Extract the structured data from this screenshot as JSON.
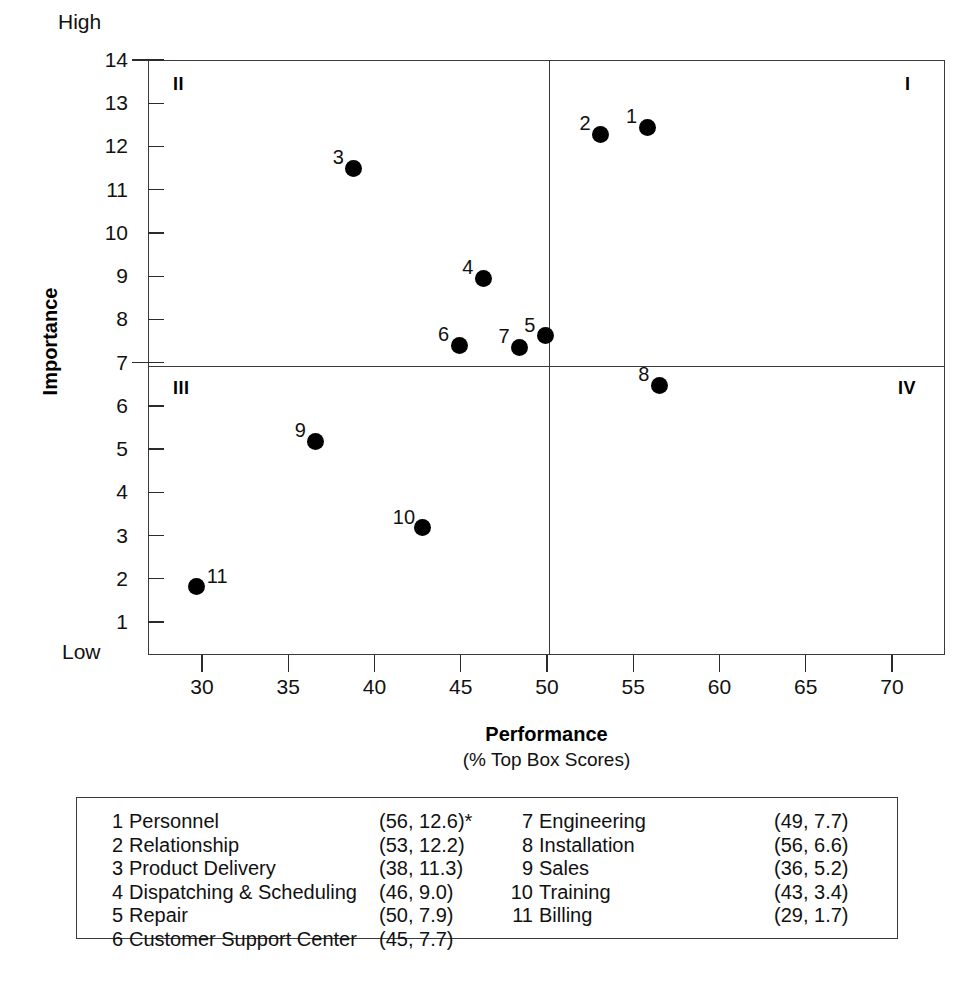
{
  "chart_data": {
    "type": "scatter",
    "title": "",
    "xlabel": "Performance",
    "xlabel_sub": "(% Top Box Scores)",
    "ylabel": "Importance",
    "y_high_label": "High",
    "y_low_label": "Low",
    "xlim": [
      27,
      73
    ],
    "ylim": [
      1,
      14
    ],
    "xticks": [
      30,
      35,
      40,
      45,
      50,
      55,
      60,
      65,
      70
    ],
    "yticks": [
      1,
      2,
      3,
      4,
      5,
      6,
      7,
      8,
      9,
      10,
      11,
      12,
      13,
      14
    ],
    "grid": false,
    "legend_position": "below-plot-boxed",
    "quadrant_divider_x": 50,
    "quadrant_divider_y": 7,
    "quadrants": [
      {
        "id": "q1",
        "label": "I",
        "position": "top-right"
      },
      {
        "id": "q2",
        "label": "II",
        "position": "top-left"
      },
      {
        "id": "q3",
        "label": "III",
        "position": "bottom-left"
      },
      {
        "id": "q4",
        "label": "IV",
        "position": "bottom-right"
      }
    ],
    "point_labels": [
      "1",
      "2",
      "3",
      "4",
      "5",
      "6",
      "7",
      "8",
      "9",
      "10",
      "11"
    ],
    "x": [
      56,
      53,
      38,
      46,
      50,
      45,
      49,
      56,
      36,
      43,
      29
    ],
    "y": [
      12.6,
      12.2,
      11.3,
      9.0,
      7.9,
      7.7,
      7.7,
      6.6,
      5.2,
      3.4,
      1.7
    ],
    "points": [
      {
        "id": "1",
        "name": "Personnel",
        "x": 56,
        "y": 12.6,
        "plot_x": 55.8,
        "plot_y": 12.45,
        "label_side": "left"
      },
      {
        "id": "2",
        "name": "Relationship",
        "x": 53,
        "y": 12.2,
        "plot_x": 53.1,
        "plot_y": 12.28,
        "label_side": "left"
      },
      {
        "id": "3",
        "name": "Product Delivery",
        "x": 38,
        "y": 11.3,
        "plot_x": 38.8,
        "plot_y": 11.5,
        "label_side": "left"
      },
      {
        "id": "4",
        "name": "Dispatching & Scheduling",
        "x": 46,
        "y": 9.0,
        "plot_x": 46.3,
        "plot_y": 8.95,
        "label_side": "left"
      },
      {
        "id": "5",
        "name": "Repair",
        "x": 50,
        "y": 7.9,
        "plot_x": 49.9,
        "plot_y": 7.62,
        "label_side": "left"
      },
      {
        "id": "6",
        "name": "Customer Support Center",
        "x": 45,
        "y": 7.7,
        "plot_x": 44.9,
        "plot_y": 7.4,
        "label_side": "left"
      },
      {
        "id": "7",
        "name": "Engineering",
        "x": 49,
        "y": 7.7,
        "plot_x": 48.4,
        "plot_y": 7.36,
        "label_side": "left"
      },
      {
        "id": "8",
        "name": "Installation",
        "x": 56,
        "y": 6.6,
        "plot_x": 56.5,
        "plot_y": 6.48,
        "label_side": "left"
      },
      {
        "id": "9",
        "name": "Sales",
        "x": 36,
        "y": 5.2,
        "plot_x": 36.6,
        "plot_y": 5.18,
        "label_side": "left"
      },
      {
        "id": "10",
        "name": "Training",
        "x": 43,
        "y": 3.4,
        "plot_x": 42.8,
        "plot_y": 3.18,
        "label_side": "left"
      },
      {
        "id": "11",
        "name": "Billing",
        "x": 29,
        "y": 1.7,
        "plot_x": 29.7,
        "plot_y": 1.82,
        "label_side": "right"
      }
    ]
  },
  "legend": {
    "left_column": [
      {
        "num": "1",
        "name": "Personnel",
        "coord": "(56, 12.6)*"
      },
      {
        "num": "2",
        "name": "Relationship",
        "coord": "(53, 12.2)"
      },
      {
        "num": "3",
        "name": "Product Delivery",
        "coord": "(38, 11.3)"
      },
      {
        "num": "4",
        "name": "Dispatching & Scheduling",
        "coord": "(46,   9.0)"
      },
      {
        "num": "5",
        "name": "Repair",
        "coord": "(50,   7.9)"
      },
      {
        "num": "6",
        "name": "Customer Support Center",
        "coord": "(45,   7.7)"
      }
    ],
    "right_column": [
      {
        "num": "7",
        "name": "Engineering",
        "coord": "(49,   7.7)"
      },
      {
        "num": "8",
        "name": "Installation",
        "coord": "(56,   6.6)"
      },
      {
        "num": "9",
        "name": "Sales",
        "coord": "(36,   5.2)"
      },
      {
        "num": "10",
        "name": "Training",
        "coord": "(43,   3.4)"
      },
      {
        "num": "11",
        "name": "Billing",
        "coord": "(29,   1.7)"
      }
    ]
  },
  "colors": {
    "marker": "#000000",
    "axis": "#3a3a3a",
    "text": "#111111",
    "background": "#ffffff"
  }
}
